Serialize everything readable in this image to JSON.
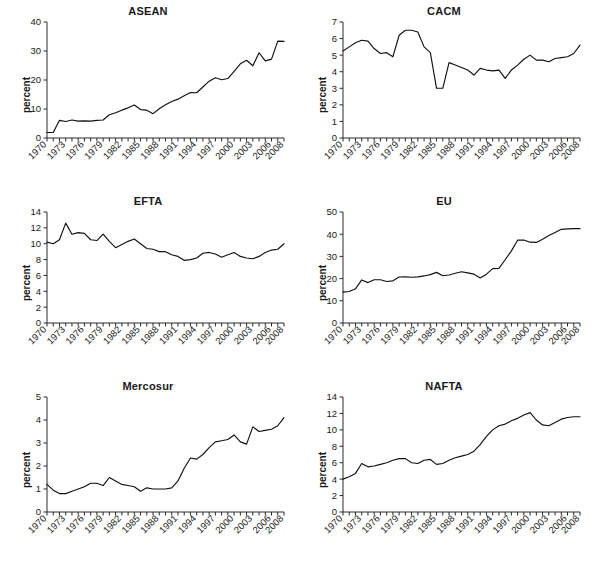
{
  "figure": {
    "ylabel": "percent",
    "x_start": 1970,
    "x_end": 2008,
    "xtick_labels": [
      "1970",
      "1973",
      "1976",
      "1979",
      "1982",
      "1985",
      "1988",
      "1991",
      "1994",
      "1997",
      "2000",
      "2003",
      "2006",
      "2008"
    ],
    "xtick_years": [
      1970,
      1973,
      1976,
      1979,
      1982,
      1985,
      1988,
      1991,
      1994,
      1997,
      2000,
      2003,
      2006,
      2008
    ],
    "line_color": "#111111",
    "axis_color": "#2a2a2a",
    "background": "#ffffff"
  },
  "chart_data": [
    {
      "type": "line",
      "title": "ASEAN",
      "xlabel": "",
      "ylabel": "percent",
      "xlim": [
        1970,
        2008
      ],
      "ylim": [
        0,
        40
      ],
      "yticks": [
        0,
        10,
        20,
        30,
        40
      ],
      "grid": false,
      "legend": "none",
      "x": [
        1970,
        1971,
        1972,
        1973,
        1974,
        1975,
        1976,
        1977,
        1978,
        1979,
        1980,
        1981,
        1982,
        1983,
        1984,
        1985,
        1986,
        1987,
        1988,
        1989,
        1990,
        1991,
        1992,
        1993,
        1994,
        1995,
        1996,
        1997,
        1998,
        1999,
        2000,
        2001,
        2002,
        2003,
        2004,
        2005,
        2006,
        2007,
        2008
      ],
      "values": [
        1.9,
        1.9,
        6.1,
        5.7,
        6.2,
        5.8,
        5.9,
        5.8,
        6.1,
        6.2,
        8.0,
        8.7,
        9.6,
        10.4,
        11.4,
        9.8,
        9.6,
        8.4,
        10.1,
        11.5,
        12.6,
        13.4,
        14.6,
        15.7,
        15.6,
        17.6,
        19.6,
        20.8,
        20.1,
        20.5,
        23.0,
        25.6,
        26.8,
        24.9,
        29.4,
        26.6,
        27.2,
        33.4,
        33.3
      ]
    },
    {
      "type": "line",
      "title": "CACM",
      "xlabel": "",
      "ylabel": "percent",
      "xlim": [
        1970,
        2008
      ],
      "ylim": [
        0,
        7
      ],
      "yticks": [
        0,
        1,
        2,
        3,
        4,
        5,
        6,
        7
      ],
      "grid": false,
      "legend": "none",
      "x": [
        1970,
        1971,
        1972,
        1973,
        1974,
        1975,
        1976,
        1977,
        1978,
        1979,
        1980,
        1981,
        1982,
        1983,
        1984,
        1985,
        1986,
        1987,
        1988,
        1989,
        1990,
        1991,
        1992,
        1993,
        1994,
        1995,
        1996,
        1997,
        1998,
        1999,
        2000,
        2001,
        2002,
        2003,
        2004,
        2005,
        2006,
        2007,
        2008
      ],
      "values": [
        5.25,
        5.5,
        5.75,
        5.9,
        5.85,
        5.4,
        5.1,
        5.15,
        4.9,
        6.2,
        6.5,
        6.5,
        6.4,
        5.5,
        5.15,
        3.0,
        3.0,
        4.55,
        4.4,
        4.25,
        4.1,
        3.8,
        4.2,
        4.1,
        4.05,
        4.1,
        3.6,
        4.1,
        4.4,
        4.75,
        5.0,
        4.7,
        4.7,
        4.6,
        4.8,
        4.85,
        4.9,
        5.1,
        5.6
      ]
    },
    {
      "type": "line",
      "title": "EFTA",
      "xlabel": "",
      "ylabel": "percent",
      "xlim": [
        1970,
        2008
      ],
      "ylim": [
        0,
        14
      ],
      "yticks": [
        0,
        2,
        4,
        6,
        8,
        10,
        12,
        14
      ],
      "grid": false,
      "legend": "none",
      "x": [
        1970,
        1971,
        1972,
        1973,
        1974,
        1975,
        1976,
        1977,
        1978,
        1979,
        1980,
        1981,
        1982,
        1983,
        1984,
        1985,
        1986,
        1987,
        1988,
        1989,
        1990,
        1991,
        1992,
        1993,
        1994,
        1995,
        1996,
        1997,
        1998,
        1999,
        2000,
        2001,
        2002,
        2003,
        2004,
        2005,
        2006,
        2007,
        2008
      ],
      "values": [
        10.2,
        10.0,
        10.5,
        12.6,
        11.2,
        11.4,
        11.3,
        10.5,
        10.4,
        11.2,
        10.3,
        9.5,
        9.9,
        10.3,
        10.6,
        10.0,
        9.4,
        9.3,
        9.0,
        9.0,
        8.6,
        8.4,
        7.9,
        8.0,
        8.2,
        8.8,
        8.9,
        8.7,
        8.3,
        8.6,
        8.9,
        8.4,
        8.2,
        8.1,
        8.4,
        8.9,
        9.2,
        9.3,
        10.0
      ]
    },
    {
      "type": "line",
      "title": "EU",
      "xlabel": "",
      "ylabel": "percent",
      "xlim": [
        1970,
        2008
      ],
      "ylim": [
        0,
        50
      ],
      "yticks": [
        0,
        10,
        20,
        30,
        40,
        50
      ],
      "grid": false,
      "legend": "none",
      "x": [
        1970,
        1971,
        1972,
        1973,
        1974,
        1975,
        1976,
        1977,
        1978,
        1979,
        1980,
        1981,
        1982,
        1983,
        1984,
        1985,
        1986,
        1987,
        1988,
        1989,
        1990,
        1991,
        1992,
        1993,
        1994,
        1995,
        1996,
        1997,
        1998,
        1999,
        2000,
        2001,
        2002,
        2003,
        2004,
        2005,
        2006,
        2007,
        2008
      ],
      "values": [
        13.9,
        14.2,
        15.4,
        19.4,
        18.2,
        19.5,
        19.5,
        18.7,
        19.0,
        20.7,
        20.8,
        20.6,
        20.8,
        21.2,
        21.8,
        22.8,
        21.3,
        21.6,
        22.4,
        23.1,
        22.6,
        22.0,
        20.3,
        22.0,
        24.5,
        24.6,
        28.5,
        32.5,
        37.3,
        37.4,
        36.4,
        36.3,
        37.7,
        39.4,
        40.8,
        42.2,
        42.4,
        42.5,
        42.5
      ]
    },
    {
      "type": "line",
      "title": "Mercosur",
      "xlabel": "",
      "ylabel": "percent",
      "xlim": [
        1970,
        2008
      ],
      "ylim": [
        0,
        5
      ],
      "yticks": [
        0,
        1,
        2,
        3,
        4,
        5
      ],
      "grid": false,
      "legend": "none",
      "x": [
        1970,
        1971,
        1972,
        1973,
        1974,
        1975,
        1976,
        1977,
        1978,
        1979,
        1980,
        1981,
        1982,
        1983,
        1984,
        1985,
        1986,
        1987,
        1988,
        1989,
        1990,
        1991,
        1992,
        1993,
        1994,
        1995,
        1996,
        1997,
        1998,
        1999,
        2000,
        2001,
        2002,
        2003,
        2004,
        2005,
        2006,
        2007,
        2008
      ],
      "values": [
        1.2,
        0.95,
        0.8,
        0.8,
        0.9,
        1.0,
        1.1,
        1.25,
        1.25,
        1.15,
        1.5,
        1.35,
        1.2,
        1.15,
        1.1,
        0.9,
        1.05,
        1.0,
        1.0,
        1.0,
        1.05,
        1.35,
        1.9,
        2.35,
        2.3,
        2.5,
        2.8,
        3.05,
        3.1,
        3.15,
        3.35,
        3.05,
        2.95,
        3.7,
        3.5,
        3.55,
        3.6,
        3.75,
        4.1
      ]
    },
    {
      "type": "line",
      "title": "NAFTA",
      "xlabel": "",
      "ylabel": "percent",
      "xlim": [
        1970,
        2008
      ],
      "ylim": [
        0,
        14
      ],
      "yticks": [
        0,
        2,
        4,
        6,
        8,
        10,
        12,
        14
      ],
      "grid": false,
      "legend": "none",
      "x": [
        1970,
        1971,
        1972,
        1973,
        1974,
        1975,
        1976,
        1977,
        1978,
        1979,
        1980,
        1981,
        1982,
        1983,
        1984,
        1985,
        1986,
        1987,
        1988,
        1989,
        1990,
        1991,
        1992,
        1993,
        1994,
        1995,
        1996,
        1997,
        1998,
        1999,
        2000,
        2001,
        2002,
        2003,
        2004,
        2005,
        2006,
        2007,
        2008
      ],
      "values": [
        4.0,
        4.3,
        4.7,
        5.9,
        5.5,
        5.6,
        5.8,
        6.0,
        6.3,
        6.5,
        6.5,
        6.0,
        5.9,
        6.3,
        6.4,
        5.8,
        5.9,
        6.3,
        6.6,
        6.8,
        7.0,
        7.4,
        8.2,
        9.2,
        10.0,
        10.5,
        10.7,
        11.1,
        11.4,
        11.8,
        12.1,
        11.2,
        10.6,
        10.5,
        10.9,
        11.3,
        11.5,
        11.6,
        11.6
      ]
    }
  ]
}
